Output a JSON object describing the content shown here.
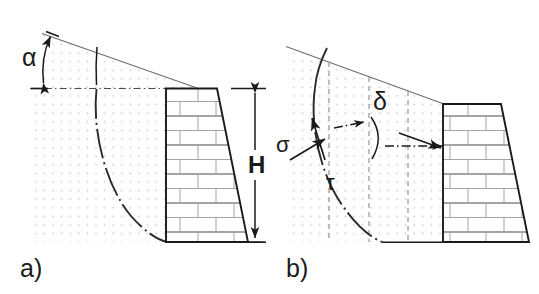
{
  "figure": {
    "type": "engineering-diagram",
    "background_color": "#ffffff",
    "line_color": "#1a1a1a",
    "soil_dot_color": "#c8c8c8",
    "masonry_joint_color": "#9a9a9a",
    "panels": [
      {
        "id": "a",
        "label": "a)",
        "annotations": [
          {
            "name": "alpha",
            "symbol": "α",
            "meaning": "backfill slope angle"
          },
          {
            "name": "H",
            "symbol": "H",
            "meaning": "wall height"
          }
        ],
        "elements": [
          "sloping-ground-surface",
          "horizontal-datum-dashdot-line",
          "curved-failure-surface",
          "masonry-gravity-wall",
          "soil-dot-fill",
          "height-dimension-line"
        ]
      },
      {
        "id": "b",
        "label": "b)",
        "annotations": [
          {
            "name": "sigma",
            "symbol": "σ",
            "meaning": "normal stress on failure surface"
          },
          {
            "name": "tau",
            "symbol": "τ",
            "meaning": "shear stress on failure surface"
          },
          {
            "name": "delta",
            "symbol": "δ",
            "meaning": "wall friction angle"
          }
        ],
        "elements": [
          "sloping-ground-surface",
          "curved-failure-surface",
          "vertical-slice-dashed-lines",
          "masonry-gravity-wall",
          "soil-dot-fill",
          "stress-arrows",
          "delta-angle-arc"
        ]
      }
    ],
    "labels": {
      "panel_a": "a)",
      "panel_b": "b)",
      "alpha": "α",
      "height": "H",
      "sigma": "σ",
      "tau": "τ",
      "delta": "δ"
    }
  }
}
